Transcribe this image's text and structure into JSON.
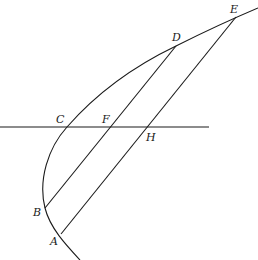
{
  "diagram": {
    "type": "geometric-figure",
    "points": {
      "A": {
        "label": "A",
        "x": 61,
        "y": 234
      },
      "B": {
        "label": "B",
        "x": 45,
        "y": 208
      },
      "C": {
        "label": "C",
        "x": 67,
        "y": 127
      },
      "D": {
        "label": "D",
        "x": 176,
        "y": 46
      },
      "E": {
        "label": "E",
        "x": 236,
        "y": 17
      },
      "F": {
        "label": "F",
        "x": 110,
        "y": 127
      },
      "H": {
        "label": "H",
        "x": 147,
        "y": 127
      }
    },
    "segments": [
      {
        "from": "B",
        "to": "D"
      },
      {
        "from": "A",
        "to": "E"
      }
    ],
    "horizontal_line": {
      "through": [
        "C",
        "F",
        "H"
      ],
      "y": 127,
      "x1": 0,
      "x2": 209
    },
    "curve": {
      "passes_through": [
        "A",
        "B",
        "C",
        "D",
        "E"
      ]
    }
  }
}
